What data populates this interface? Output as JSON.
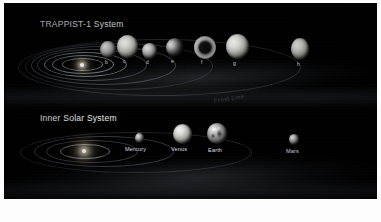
{
  "figure": {
    "border_color": "#ffffff",
    "background_color": "#000000",
    "annotation": "Frost Line"
  },
  "trappist": {
    "heading": "TRAPPIST-1 System",
    "star_name": "TRAPPIST-1",
    "planets": [
      {
        "label": "b"
      },
      {
        "label": "c"
      },
      {
        "label": "d"
      },
      {
        "label": "e"
      },
      {
        "label": "f"
      },
      {
        "label": "g"
      },
      {
        "label": "h"
      }
    ]
  },
  "solar": {
    "heading": "Inner Solar System",
    "star_name": "Sun",
    "planets": [
      {
        "label": "Mercury"
      },
      {
        "label": "Venus"
      },
      {
        "label": "Earth"
      },
      {
        "label": "Mars"
      }
    ]
  }
}
